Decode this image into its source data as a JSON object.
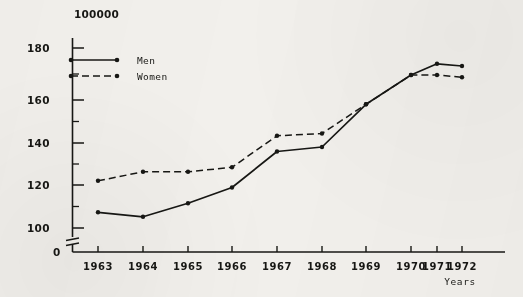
{
  "chart_data": {
    "type": "line",
    "title": "",
    "units_note": "100000",
    "xlabel": "Years",
    "ylabel": "",
    "categories": [
      "1963",
      "1964",
      "1965",
      "1966",
      "1967",
      "1968",
      "1969",
      "1970",
      "1971",
      "1972"
    ],
    "ytick_labels": [
      "180",
      "160",
      "140",
      "120",
      "100",
      "0"
    ],
    "ytick_values": [
      180,
      160,
      140,
      120,
      100,
      0
    ],
    "minor_ytick_values": [
      170,
      150,
      130,
      110
    ],
    "ylim": [
      100,
      188
    ],
    "axis_break": true,
    "grid": false,
    "legend_position": "top-left",
    "series": [
      {
        "name": "Men",
        "style": "solid",
        "marker": "dot",
        "values": [
          107,
          105,
          111,
          118,
          134,
          136,
          155,
          168,
          173,
          172
        ]
      },
      {
        "name": "Women",
        "style": "dashed",
        "marker": "dot",
        "values": [
          121,
          125,
          125,
          127,
          141,
          142,
          155,
          168,
          168,
          167
        ]
      }
    ]
  },
  "legend": {
    "men_label": "Men",
    "women_label": "Women"
  },
  "axes": {
    "y_unit_header": "100000",
    "x_axis_title": "Years"
  },
  "colors": {
    "ink": "#171714",
    "background": "#f2f0ec"
  }
}
